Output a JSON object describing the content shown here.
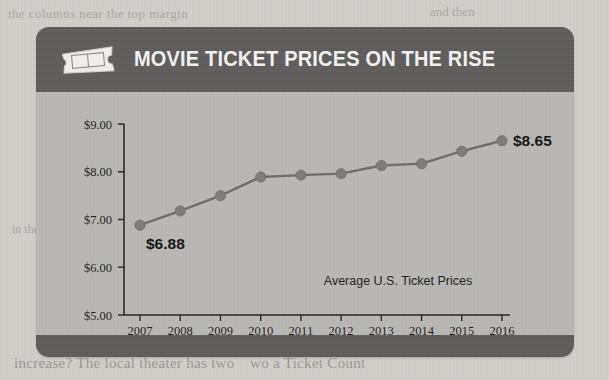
{
  "card": {
    "header": {
      "title": "MOVIE TICKET PRICES ON THE RISE",
      "icon": "movie-ticket-icon"
    },
    "colors": {
      "header_bar": "#5d5c5a",
      "card_body": "#b8b7b3",
      "footer_bar": "#5d5c5a",
      "line": "#6d6c6b",
      "marker": "#7c7b7a",
      "axis": "#26262a",
      "title_text": "#f2f1ef"
    }
  },
  "page_background_text": {
    "top_left": "the columns near the top margin",
    "top_right": "and then",
    "middle_left": "in the",
    "bottom_left": "increase? The local theater has two",
    "bottom_right": "wo a Ticket Count"
  },
  "chart_data": {
    "type": "line",
    "title": "MOVIE TICKET PRICES ON THE RISE",
    "annotation": "Average U.S. Ticket Prices",
    "xlabel": "",
    "ylabel": "",
    "categories": [
      "2007",
      "2008",
      "2009",
      "2010",
      "2011",
      "2012",
      "2013",
      "2014",
      "2015",
      "2016"
    ],
    "values": [
      6.88,
      7.18,
      7.5,
      7.89,
      7.93,
      7.96,
      8.13,
      8.17,
      8.43,
      8.65
    ],
    "ylim": [
      5.0,
      9.0
    ],
    "ytick_values": [
      5.0,
      6.0,
      7.0,
      8.0,
      9.0
    ],
    "ytick_labels": [
      "$5.00",
      "$6.00",
      "$7.00",
      "$8.00",
      "$9.00"
    ],
    "xtick_labels": [
      "2007",
      "2008",
      "2009",
      "2010",
      "2011",
      "2012",
      "2013",
      "2014",
      "2015",
      "2016"
    ],
    "grid": false,
    "legend": "none",
    "point_labels": [
      {
        "category": "2007",
        "value": 6.88,
        "text": "$6.88",
        "position": "below-right"
      },
      {
        "category": "2016",
        "value": 8.65,
        "text": "$8.65",
        "position": "right"
      }
    ],
    "marker": "circle",
    "line_color": "#6d6c6b"
  }
}
